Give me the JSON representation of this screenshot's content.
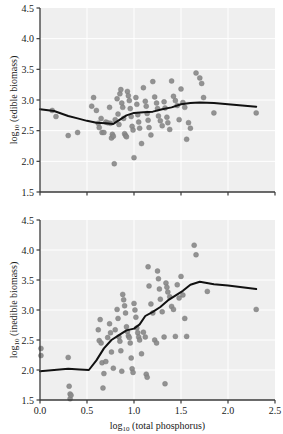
{
  "figure": {
    "background_color": "#ffffff",
    "panel_background_color": "#efefef",
    "grid_color": "#ffffff",
    "point_color": "#8a8a8a",
    "point_edge_color": "#7a7a7a",
    "trend_line_color": "#111111",
    "axis_color": "#3a3a3a"
  },
  "chart_data": [
    {
      "type": "scatter",
      "panel": "top",
      "title": "",
      "xlabel": "",
      "ylabel": "log10 (edible biomass)",
      "ylabel_base": "log",
      "ylabel_sub": "10",
      "ylabel_rest": " (edible biomass)",
      "xlim": [
        0.0,
        2.5
      ],
      "ylim": [
        1.5,
        4.5
      ],
      "xticks": [
        0.0,
        0.5,
        1.0,
        1.5,
        2.0,
        2.5
      ],
      "xticklabels": [
        "0.0",
        "0.5",
        "1.0",
        "1.5",
        "2.0",
        "2.5"
      ],
      "yticks": [
        1.5,
        2.0,
        2.5,
        3.0,
        3.5,
        4.0,
        4.5
      ],
      "yticklabels": [
        "1.5",
        "2.0",
        "2.5",
        "3.0",
        "3.5",
        "4.0",
        "4.5"
      ],
      "grid": true,
      "legend": "none",
      "points": [
        [
          0.13,
          2.83
        ],
        [
          0.17,
          2.73
        ],
        [
          0.3,
          2.42
        ],
        [
          0.4,
          2.47
        ],
        [
          0.55,
          2.9
        ],
        [
          0.57,
          3.04
        ],
        [
          0.6,
          2.83
        ],
        [
          0.62,
          2.62
        ],
        [
          0.63,
          2.55
        ],
        [
          0.65,
          2.7
        ],
        [
          0.66,
          2.47
        ],
        [
          0.68,
          2.47
        ],
        [
          0.7,
          2.64
        ],
        [
          0.72,
          2.63
        ],
        [
          0.74,
          2.88
        ],
        [
          0.75,
          2.62
        ],
        [
          0.76,
          2.38
        ],
        [
          0.77,
          2.44
        ],
        [
          0.78,
          2.41
        ],
        [
          0.79,
          1.96
        ],
        [
          0.8,
          2.68
        ],
        [
          0.82,
          3.02
        ],
        [
          0.83,
          2.77
        ],
        [
          0.84,
          2.6
        ],
        [
          0.85,
          3.1
        ],
        [
          0.86,
          3.17
        ],
        [
          0.87,
          2.95
        ],
        [
          0.88,
          2.88
        ],
        [
          0.89,
          2.7
        ],
        [
          0.9,
          2.45
        ],
        [
          0.91,
          2.42
        ],
        [
          0.92,
          2.4
        ],
        [
          0.93,
          3.14
        ],
        [
          0.94,
          3.07
        ],
        [
          0.95,
          2.99
        ],
        [
          0.96,
          2.86
        ],
        [
          0.97,
          2.73
        ],
        [
          0.98,
          2.57
        ],
        [
          0.99,
          2.51
        ],
        [
          1.0,
          2.06
        ],
        [
          1.02,
          3.04
        ],
        [
          1.03,
          2.93
        ],
        [
          1.04,
          2.76
        ],
        [
          1.05,
          2.64
        ],
        [
          1.06,
          2.54
        ],
        [
          1.08,
          2.29
        ],
        [
          1.1,
          3.2
        ],
        [
          1.12,
          2.98
        ],
        [
          1.13,
          2.9
        ],
        [
          1.14,
          2.78
        ],
        [
          1.15,
          2.67
        ],
        [
          1.16,
          2.55
        ],
        [
          1.18,
          2.43
        ],
        [
          1.2,
          3.3
        ],
        [
          1.22,
          3.05
        ],
        [
          1.24,
          2.95
        ],
        [
          1.25,
          2.86
        ],
        [
          1.26,
          2.74
        ],
        [
          1.28,
          2.66
        ],
        [
          1.3,
          2.58
        ],
        [
          1.32,
          2.97
        ],
        [
          1.33,
          2.87
        ],
        [
          1.35,
          2.72
        ],
        [
          1.36,
          2.63
        ],
        [
          1.38,
          2.52
        ],
        [
          1.4,
          3.31
        ],
        [
          1.42,
          3.06
        ],
        [
          1.44,
          2.99
        ],
        [
          1.46,
          2.91
        ],
        [
          1.48,
          2.68
        ],
        [
          1.5,
          3.18
        ],
        [
          1.52,
          2.96
        ],
        [
          1.54,
          2.88
        ],
        [
          1.56,
          2.36
        ],
        [
          1.58,
          2.63
        ],
        [
          1.6,
          2.54
        ],
        [
          1.66,
          3.44
        ],
        [
          1.7,
          3.36
        ],
        [
          1.72,
          3.27
        ],
        [
          1.74,
          3.04
        ],
        [
          1.85,
          2.79
        ],
        [
          2.3,
          2.79
        ]
      ],
      "trend_line": [
        [
          0.0,
          2.85
        ],
        [
          0.15,
          2.82
        ],
        [
          0.3,
          2.74
        ],
        [
          0.4,
          2.7
        ],
        [
          0.5,
          2.66
        ],
        [
          0.6,
          2.63
        ],
        [
          0.7,
          2.62
        ],
        [
          0.78,
          2.61
        ],
        [
          0.85,
          2.68
        ],
        [
          0.92,
          2.75
        ],
        [
          1.0,
          2.79
        ],
        [
          1.1,
          2.8
        ],
        [
          1.2,
          2.81
        ],
        [
          1.3,
          2.85
        ],
        [
          1.4,
          2.88
        ],
        [
          1.5,
          2.93
        ],
        [
          1.6,
          2.95
        ],
        [
          1.7,
          2.96
        ],
        [
          1.85,
          2.95
        ],
        [
          2.0,
          2.93
        ],
        [
          2.15,
          2.91
        ],
        [
          2.3,
          2.89
        ]
      ]
    },
    {
      "type": "scatter",
      "panel": "bottom",
      "title": "",
      "xlabel": "log10 (total phosphorus)",
      "xlabel_base": "log",
      "xlabel_sub": "10",
      "xlabel_rest": " (total phosphorus)",
      "ylabel": "log10 (inedible biomass)",
      "ylabel_base": "log",
      "ylabel_sub": "10",
      "ylabel_rest": " (inedible biomass)",
      "xlim": [
        0.0,
        2.5
      ],
      "ylim": [
        1.5,
        4.5
      ],
      "xticks": [
        0.0,
        0.5,
        1.0,
        1.5,
        2.0,
        2.5
      ],
      "xticklabels": [
        "0.0",
        "0.5",
        "1.0",
        "1.5",
        "2.0",
        "2.5"
      ],
      "yticks": [
        1.5,
        2.0,
        2.5,
        3.0,
        3.5,
        4.0,
        4.5
      ],
      "yticklabels": [
        "1.5",
        "2.0",
        "2.5",
        "3.0",
        "3.5",
        "4.0",
        "4.5"
      ],
      "grid": true,
      "legend": "none",
      "points": [
        [
          0.01,
          2.36
        ],
        [
          0.01,
          2.24
        ],
        [
          0.3,
          2.21
        ],
        [
          0.31,
          1.73
        ],
        [
          0.32,
          1.6
        ],
        [
          0.32,
          1.52
        ],
        [
          0.33,
          1.58
        ],
        [
          0.62,
          2.67
        ],
        [
          0.63,
          2.49
        ],
        [
          0.64,
          2.84
        ],
        [
          0.65,
          2.45
        ],
        [
          0.66,
          2.12
        ],
        [
          0.67,
          1.7
        ],
        [
          0.68,
          1.94
        ],
        [
          0.7,
          2.14
        ],
        [
          0.72,
          2.54
        ],
        [
          0.74,
          2.77
        ],
        [
          0.75,
          2.62
        ],
        [
          0.76,
          2.3
        ],
        [
          0.78,
          2.03
        ],
        [
          0.8,
          2.67
        ],
        [
          0.82,
          3.01
        ],
        [
          0.83,
          2.86
        ],
        [
          0.84,
          2.55
        ],
        [
          0.85,
          2.48
        ],
        [
          0.86,
          2.32
        ],
        [
          0.87,
          1.98
        ],
        [
          0.88,
          3.26
        ],
        [
          0.89,
          3.17
        ],
        [
          0.9,
          3.07
        ],
        [
          0.91,
          2.95
        ],
        [
          0.92,
          2.72
        ],
        [
          0.93,
          2.64
        ],
        [
          0.94,
          2.57
        ],
        [
          0.95,
          2.54
        ],
        [
          0.96,
          2.45
        ],
        [
          0.97,
          2.2
        ],
        [
          0.98,
          2.02
        ],
        [
          0.99,
          1.96
        ],
        [
          1.0,
          3.11
        ],
        [
          1.01,
          3.0
        ],
        [
          1.02,
          2.88
        ],
        [
          1.03,
          2.7
        ],
        [
          1.04,
          2.62
        ],
        [
          1.05,
          2.55
        ],
        [
          1.06,
          2.5
        ],
        [
          1.08,
          2.27
        ],
        [
          1.1,
          2.63
        ],
        [
          1.12,
          2.55
        ],
        [
          1.13,
          1.93
        ],
        [
          1.14,
          1.88
        ],
        [
          1.15,
          3.72
        ],
        [
          1.16,
          3.4
        ],
        [
          1.18,
          3.1
        ],
        [
          1.2,
          2.95
        ],
        [
          1.22,
          2.5
        ],
        [
          1.24,
          2.45
        ],
        [
          1.25,
          3.65
        ],
        [
          1.26,
          3.52
        ],
        [
          1.27,
          3.35
        ],
        [
          1.28,
          3.18
        ],
        [
          1.3,
          2.97
        ],
        [
          1.32,
          2.55
        ],
        [
          1.33,
          1.77
        ],
        [
          1.34,
          3.45
        ],
        [
          1.35,
          3.38
        ],
        [
          1.36,
          3.3
        ],
        [
          1.38,
          3.22
        ],
        [
          1.4,
          3.06
        ],
        [
          1.42,
          3.01
        ],
        [
          1.44,
          2.56
        ],
        [
          1.46,
          3.42
        ],
        [
          1.48,
          3.2
        ],
        [
          1.5,
          3.56
        ],
        [
          1.52,
          3.25
        ],
        [
          1.54,
          2.86
        ],
        [
          1.56,
          2.56
        ],
        [
          1.64,
          4.08
        ],
        [
          1.66,
          3.92
        ],
        [
          1.78,
          3.31
        ],
        [
          2.3,
          3.01
        ]
      ],
      "trend_line": [
        [
          0.0,
          1.98
        ],
        [
          0.15,
          2.0
        ],
        [
          0.3,
          2.02
        ],
        [
          0.42,
          2.01
        ],
        [
          0.52,
          2.0
        ],
        [
          0.6,
          2.16
        ],
        [
          0.68,
          2.36
        ],
        [
          0.76,
          2.5
        ],
        [
          0.84,
          2.58
        ],
        [
          0.92,
          2.66
        ],
        [
          1.0,
          2.69
        ],
        [
          1.06,
          2.76
        ],
        [
          1.12,
          2.9
        ],
        [
          1.2,
          2.97
        ],
        [
          1.28,
          3.05
        ],
        [
          1.36,
          3.16
        ],
        [
          1.44,
          3.24
        ],
        [
          1.52,
          3.32
        ],
        [
          1.6,
          3.42
        ],
        [
          1.7,
          3.47
        ],
        [
          1.85,
          3.43
        ],
        [
          2.0,
          3.41
        ],
        [
          2.15,
          3.38
        ],
        [
          2.3,
          3.35
        ]
      ]
    }
  ]
}
